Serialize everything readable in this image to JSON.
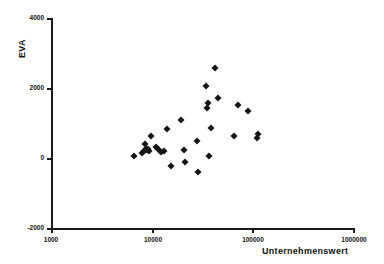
{
  "chart_data": {
    "type": "scatter",
    "title": "",
    "xlabel": "Unternehmenswert",
    "ylabel": "EVA",
    "xscale": "log",
    "yscale": "linear",
    "xlim": [
      1000,
      1000000
    ],
    "ylim": [
      -2000,
      4000
    ],
    "grid": false,
    "legend": null,
    "xticks": [
      1000,
      10000,
      100000,
      1000000
    ],
    "xtick_labels": [
      "1000",
      "10000",
      "100000",
      "1000000"
    ],
    "yticks": [
      -2000,
      0,
      2000,
      4000
    ],
    "ytick_labels": [
      "-2000",
      "0",
      "2000",
      "4000"
    ],
    "marker": "diamond",
    "marker_color": "#141414",
    "points": [
      {
        "x": 6600,
        "y": 60
      },
      {
        "x": 8100,
        "y": 130
      },
      {
        "x": 8300,
        "y": 190
      },
      {
        "x": 8600,
        "y": 400
      },
      {
        "x": 8700,
        "y": 250
      },
      {
        "x": 8900,
        "y": 230
      },
      {
        "x": 9100,
        "y": 250
      },
      {
        "x": 9400,
        "y": 200
      },
      {
        "x": 9800,
        "y": 640
      },
      {
        "x": 11000,
        "y": 310
      },
      {
        "x": 11500,
        "y": 270
      },
      {
        "x": 12500,
        "y": 180
      },
      {
        "x": 13200,
        "y": 200
      },
      {
        "x": 14200,
        "y": 830
      },
      {
        "x": 15500,
        "y": -230
      },
      {
        "x": 19500,
        "y": 1080
      },
      {
        "x": 21000,
        "y": 220
      },
      {
        "x": 21500,
        "y": -110
      },
      {
        "x": 28500,
        "y": 480
      },
      {
        "x": 29000,
        "y": -400
      },
      {
        "x": 34500,
        "y": 2060
      },
      {
        "x": 35500,
        "y": 1420
      },
      {
        "x": 36500,
        "y": 1570
      },
      {
        "x": 37000,
        "y": 70
      },
      {
        "x": 38500,
        "y": 860
      },
      {
        "x": 43000,
        "y": 2570
      },
      {
        "x": 46000,
        "y": 1710
      },
      {
        "x": 66000,
        "y": 620
      },
      {
        "x": 72000,
        "y": 1520
      },
      {
        "x": 90000,
        "y": 1340
      },
      {
        "x": 112000,
        "y": 560
      },
      {
        "x": 114000,
        "y": 680
      }
    ]
  }
}
